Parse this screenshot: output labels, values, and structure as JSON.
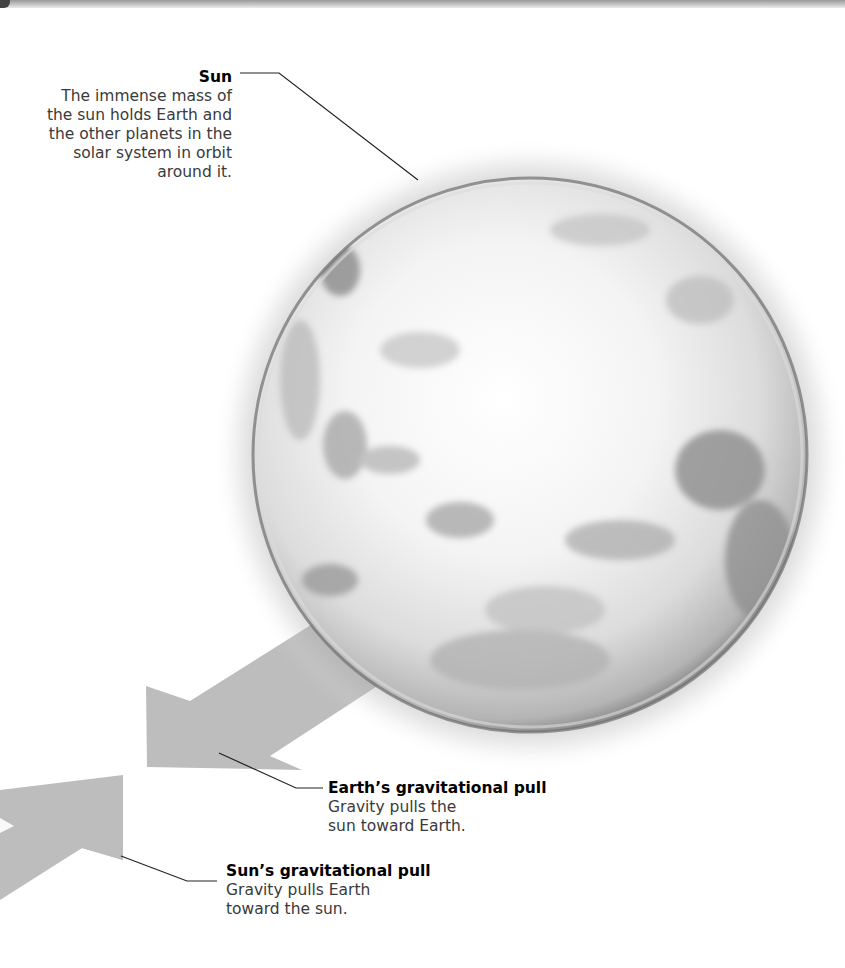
{
  "diagram": {
    "sun": {
      "title": "Sun",
      "description": "The immense mass of the sun holds Earth and the other planets in the solar system in orbit around it."
    },
    "earth_pull": {
      "title": "Earth’s gravitational pull",
      "description": "Gravity pulls the sun toward Earth."
    },
    "sun_pull": {
      "title": "Sun’s gravitational pull",
      "description": "Gravity pulls Earth toward the sun."
    },
    "colors": {
      "arrow": "#bdbdbd",
      "leader_line": "#222222",
      "title_text": "#000000",
      "body_text": "#3a3a3a"
    }
  }
}
